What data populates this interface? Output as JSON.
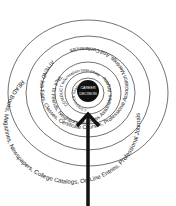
{
  "diagram": {
    "center_label_line1": "CAREER",
    "center_label_line2": "DECISION",
    "rings": [
      {
        "id": "consider",
        "text": "CONSIDER Shadowing"
      },
      {
        "id": "conduct",
        "text": "CONDUCT Information Interviews"
      },
      {
        "id": "talk",
        "text": "TALK To Friends, Neighbors, Business Associates, Anyone"
      },
      {
        "id": "attend",
        "text": "ATTEND Job Fairs, Classes, Certificate Courses, Professional Association Meetings, And Conferences"
      },
      {
        "id": "read",
        "text": "READ Books, Magazines, Newspapers, College Catalogs, On-Line Entries, Professional Journals"
      }
    ],
    "arrow": "inward-arrow",
    "colors": {
      "ink": "#222222",
      "disc": "#111111",
      "background": "#ffffff"
    }
  }
}
